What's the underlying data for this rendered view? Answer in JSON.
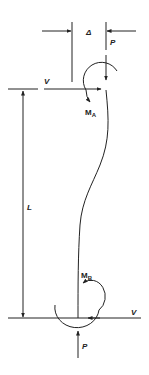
{
  "diagram": {
    "type": "column-free-body-diagram",
    "stroke_color": "#222222",
    "background": "#ffffff",
    "labels": {
      "delta": "Δ",
      "p_top": "P",
      "v_top": "V",
      "m_a_main": "M",
      "m_a_sub": "A",
      "length": "L",
      "m_b_main": "M",
      "m_b_sub": "B",
      "v_bottom": "V",
      "p_bottom": "P"
    }
  }
}
